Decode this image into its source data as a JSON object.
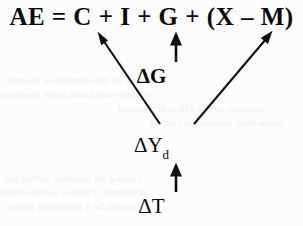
{
  "diagram": {
    "type": "economics-flow-diagram",
    "background_color": "#fcfcfc",
    "ink_color": "#111111"
  },
  "equation": {
    "text": "AE = C + I + G + (X – M)",
    "terms": [
      "AE",
      "=",
      "C",
      "+",
      "I",
      "+",
      "G",
      "+",
      "(X – M)"
    ]
  },
  "nodes": {
    "delta_g": {
      "label": "ΔG",
      "bold": true
    },
    "delta_yd": {
      "symbol": "ΔY",
      "subscript": "d",
      "label": "ΔY_d",
      "bold": false
    },
    "delta_t": {
      "label": "ΔT",
      "bold": false
    }
  },
  "arrows": [
    {
      "name": "delta-yd-to-consumption",
      "from": "ΔY_d",
      "to": "C",
      "direction": "up-left"
    },
    {
      "name": "delta-g-to-government-spending",
      "from": "ΔG",
      "to": "G",
      "direction": "up"
    },
    {
      "name": "delta-yd-to-net-exports",
      "from": "ΔY_d",
      "to": "(X – M)",
      "direction": "up-right"
    },
    {
      "name": "delta-t-to-delta-yd",
      "from": "ΔT",
      "to": "ΔY_d",
      "direction": "up"
    }
  ],
  "bleed_through": {
    "note": "faint show-through text from reverse side of scanned page",
    "lines": [
      "some of the increase in income",
      "will be saved and some spent on",
      "imports, so the effect is damped",
      "down over successive rounds",
      "raising all incomes within the",
      "economy, if this is so then there",
      "would be a multiplier effect"
    ]
  }
}
